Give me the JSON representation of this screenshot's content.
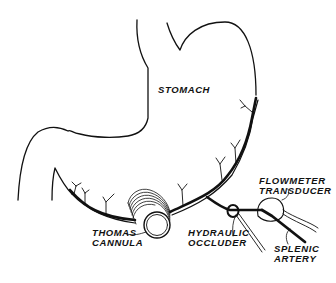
{
  "diagram": {
    "labels": {
      "stomach": "STOMACH",
      "thomas_cannula": [
        "THOMAS",
        "CANNULA"
      ],
      "hydraulic_occluder": [
        "HYDRAULIC",
        "OCCLUDER"
      ],
      "flowmeter_transducer": [
        "FLOWMETER",
        "TRANSDUCER"
      ],
      "splenic_artery": [
        "SPLENIC",
        "ARTERY"
      ]
    },
    "colors": {
      "ink": "#111111",
      "background": "#ffffff"
    }
  }
}
